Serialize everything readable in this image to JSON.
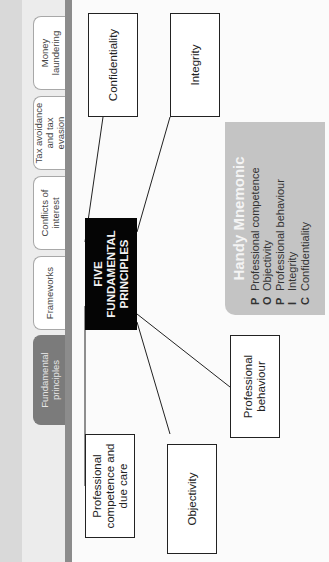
{
  "tabs": [
    {
      "label": "Fundamental principles",
      "active": true
    },
    {
      "label": "Frameworks",
      "active": false
    },
    {
      "label": "Conflicts of interest",
      "active": false
    },
    {
      "label": "Tax avoidance and tax evasion",
      "active": false
    },
    {
      "label": "Money laundering",
      "active": false
    }
  ],
  "diagram": {
    "center": "FIVE FUNDAMENTAL PRINCIPLES",
    "nodes": {
      "professional_competence": "Professional competence and due care",
      "objectivity": "Objectivity",
      "professional_behaviour": "Professional behaviour",
      "integrity": "Integrity",
      "confidentiality": "Confidentiality"
    }
  },
  "mnemonic": {
    "title": "Handy Mnemonic",
    "items": [
      {
        "letter": "P",
        "text": "Professional competence"
      },
      {
        "letter": "O",
        "text": "Objectivity"
      },
      {
        "letter": "P",
        "text": "Professional behaviour"
      },
      {
        "letter": "I",
        "text": "Integrity"
      },
      {
        "letter": "C",
        "text": "Confidentiality"
      }
    ]
  },
  "colors": {
    "active_tab": "#7b7b7b",
    "center_box": "#050505",
    "mnemonic_panel": "#c4c4c4",
    "tab_bar": "#8c8c8c"
  }
}
